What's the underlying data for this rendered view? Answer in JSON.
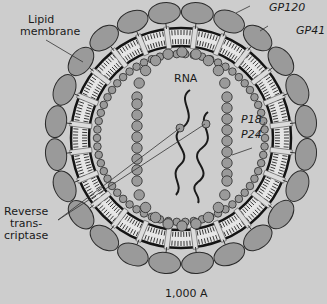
{
  "labels": {
    "lipid_membrane_1": "Lipid",
    "lipid_membrane_2": "membrane",
    "gp120": "GP120",
    "gp41": "GP41",
    "rna": "RNA",
    "p18": "P18",
    "p24": "P24",
    "rt_1": "Reverse",
    "rt_2": "trans-",
    "rt_3": "criptase",
    "scale": "1,000 A"
  },
  "colors": {
    "background": "#cdcdcd",
    "protein_fill": "#9a9a9a",
    "outline": "#2a2a2a",
    "membrane_dark": "#141414",
    "membrane_light": "#e6e6e6"
  }
}
